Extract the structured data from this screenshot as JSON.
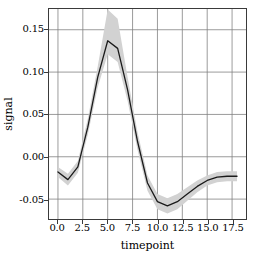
{
  "chart_data": {
    "type": "line",
    "title": "",
    "xlabel": "timepoint",
    "ylabel": "signal",
    "xlim": [
      -0.9,
      18.9
    ],
    "ylim": [
      -0.0735,
      0.1745
    ],
    "grid": true,
    "legend": null,
    "xticks": [
      0.0,
      2.5,
      5.0,
      7.5,
      10.0,
      12.5,
      15.0,
      17.5
    ],
    "xtick_labels": [
      "0.0",
      "2.5",
      "5.0",
      "7.5",
      "10.0",
      "12.5",
      "15.0",
      "17.5"
    ],
    "yticks": [
      -0.05,
      0.0,
      0.05,
      0.1,
      0.15
    ],
    "ytick_labels": [
      "-0.05",
      "0.00",
      "0.05",
      "0.10",
      "0.15"
    ],
    "line_color": "#1a1a1a",
    "band_color": "#d2d2d2",
    "grid_color": "#808080",
    "x": [
      0,
      1,
      2,
      3,
      4,
      5,
      6,
      7,
      8,
      9,
      10,
      11,
      12,
      13,
      14,
      15,
      16,
      17,
      18
    ],
    "series": [
      {
        "name": "signal",
        "values": [
          -0.018,
          -0.027,
          -0.012,
          0.035,
          0.094,
          0.137,
          0.128,
          0.079,
          0.018,
          -0.031,
          -0.053,
          -0.058,
          -0.053,
          -0.044,
          -0.035,
          -0.028,
          -0.024,
          -0.023,
          -0.023
        ],
        "ci_lower": [
          -0.024,
          -0.034,
          -0.019,
          0.026,
          0.082,
          0.121,
          0.112,
          0.066,
          0.008,
          -0.04,
          -0.062,
          -0.067,
          -0.062,
          -0.052,
          -0.042,
          -0.034,
          -0.03,
          -0.029,
          -0.029
        ],
        "ci_upper": [
          -0.012,
          -0.02,
          -0.005,
          0.045,
          0.107,
          0.174,
          0.163,
          0.094,
          0.029,
          -0.022,
          -0.044,
          -0.049,
          -0.044,
          -0.036,
          -0.028,
          -0.022,
          -0.018,
          -0.017,
          -0.017
        ]
      }
    ]
  }
}
